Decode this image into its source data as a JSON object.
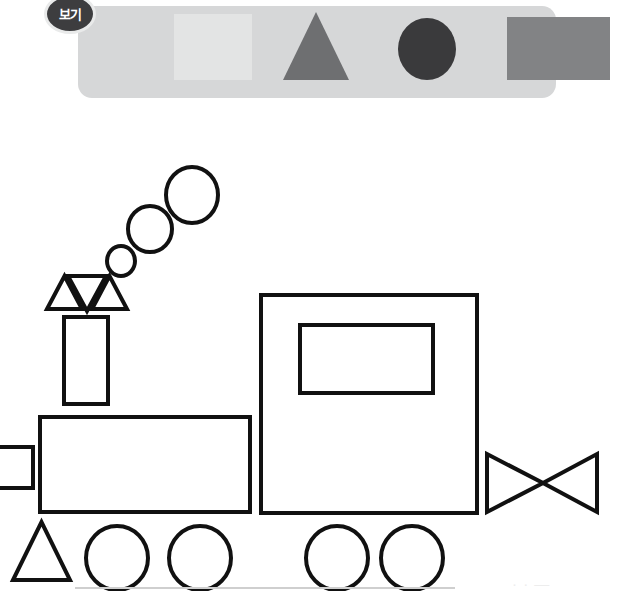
{
  "page": {
    "width": 632,
    "height": 591,
    "background": "#ffffff"
  },
  "legend": {
    "badge_label": "보기",
    "badge_bg": "#3d3d3f",
    "badge_text_color": "#ffffff",
    "panel_bg": "#d6d7d8",
    "shapes": [
      {
        "name": "square",
        "label": "square",
        "color": "#e3e4e4"
      },
      {
        "name": "triangle",
        "label": "triangle",
        "color": "#6e6f71"
      },
      {
        "name": "circle",
        "label": "circle",
        "color": "#3a3a3c"
      },
      {
        "name": "rectangle",
        "label": "rectangle",
        "color": "#828385"
      }
    ]
  },
  "drawing": {
    "name": "steam-train",
    "stroke_color": "#111111",
    "fill_color": "#ffffff",
    "stroke_width": 4,
    "ground_line_color": "#cfcfcf",
    "parts": [
      {
        "name": "smoke-puff-small",
        "shape": "circle",
        "cx": 121,
        "cy": 261,
        "rx": 14,
        "ry": 15
      },
      {
        "name": "smoke-puff-medium",
        "shape": "circle",
        "cx": 150,
        "cy": 229,
        "rx": 22,
        "ry": 23
      },
      {
        "name": "smoke-puff-large",
        "shape": "circle",
        "cx": 192,
        "cy": 195,
        "rx": 26,
        "ry": 28
      },
      {
        "name": "chimney-flare-left",
        "shape": "triangle-up",
        "x": 47,
        "y": 276,
        "w": 35,
        "h": 33
      },
      {
        "name": "chimney-flare-middle",
        "shape": "triangle-down",
        "x": 68,
        "y": 276,
        "w": 38,
        "h": 35
      },
      {
        "name": "chimney-flare-right",
        "shape": "triangle-up",
        "x": 92,
        "y": 276,
        "w": 35,
        "h": 33
      },
      {
        "name": "chimney-stack",
        "shape": "rect",
        "x": 64,
        "y": 317,
        "w": 44,
        "h": 87
      },
      {
        "name": "boiler-body",
        "shape": "rect",
        "x": 40,
        "y": 417,
        "w": 210,
        "h": 95
      },
      {
        "name": "front-coupler",
        "shape": "rect",
        "x": -14,
        "y": 447,
        "w": 47,
        "h": 41
      },
      {
        "name": "cab-body",
        "shape": "rect",
        "x": 261,
        "y": 295,
        "w": 216,
        "h": 218
      },
      {
        "name": "cab-window",
        "shape": "rect",
        "x": 300,
        "y": 325,
        "w": 133,
        "h": 68
      },
      {
        "name": "cowcatcher",
        "shape": "triangle-up",
        "x": 13,
        "y": 522,
        "w": 57,
        "h": 58
      },
      {
        "name": "wheel-front-1",
        "shape": "circle",
        "cx": 117,
        "cy": 556,
        "rx": 31,
        "ry": 32
      },
      {
        "name": "wheel-front-2",
        "shape": "circle",
        "cx": 200,
        "cy": 556,
        "rx": 31,
        "ry": 32
      },
      {
        "name": "wheel-rear-1",
        "shape": "circle",
        "cx": 337,
        "cy": 556,
        "rx": 31,
        "ry": 32
      },
      {
        "name": "wheel-rear-2",
        "shape": "circle",
        "cx": 412,
        "cy": 556,
        "rx": 31,
        "ry": 32
      },
      {
        "name": "rear-bowtie-left",
        "shape": "triangle-right",
        "x": 487,
        "y": 454,
        "w": 55,
        "h": 58
      },
      {
        "name": "rear-bowtie-right",
        "shape": "triangle-left",
        "x": 542,
        "y": 454,
        "w": 55,
        "h": 58
      }
    ]
  },
  "footer": {
    "mark": "· · —"
  }
}
